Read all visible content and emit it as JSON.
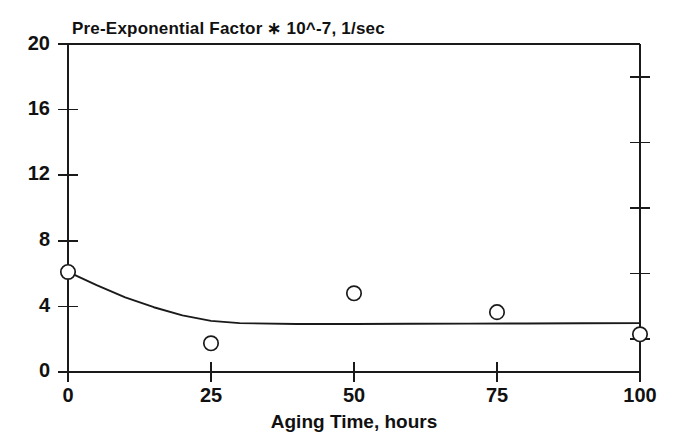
{
  "chart_data": {
    "type": "scatter",
    "title": "Pre-Exponential Factor ∗ 10^-7, 1/sec",
    "xlabel": "Aging Time, hours",
    "ylabel": "",
    "xlim": [
      0,
      100
    ],
    "ylim": [
      0,
      20
    ],
    "grid": false,
    "legend": "none",
    "x_ticks": [
      0,
      25,
      50,
      75,
      100
    ],
    "x_tick_labels": [
      "0",
      "25",
      "50",
      "75",
      "100"
    ],
    "y_ticks": [
      0,
      4,
      8,
      12,
      16,
      20
    ],
    "y_tick_labels": [
      "0",
      "4",
      "8",
      "12",
      "16",
      "20"
    ],
    "y_minor_ticks_right": [
      2,
      6,
      10,
      14,
      18
    ],
    "marker_style": "open-circle",
    "series": [
      {
        "name": "Measured pre-exponential factor",
        "x": [
          0,
          25,
          50,
          75,
          100
        ],
        "values": [
          6.1,
          1.75,
          4.8,
          3.65,
          2.3
        ]
      },
      {
        "name": "Fitted decay curve",
        "x": [
          0,
          5,
          10,
          15,
          20,
          25,
          30,
          40,
          50,
          60,
          70,
          80,
          90,
          100
        ],
        "values": [
          6.1,
          5.3,
          4.55,
          3.95,
          3.45,
          3.12,
          2.98,
          2.93,
          2.93,
          2.94,
          2.95,
          2.96,
          2.97,
          2.98
        ]
      }
    ]
  },
  "axes": {
    "title_text": "Pre-Exponential Factor ∗ 10^-7, 1/sec",
    "x_axis_title": "Aging Time, hours"
  },
  "colors": {
    "ink": "#1a1a1a",
    "background": "#ffffff",
    "marker_fill": "#ffffff"
  }
}
